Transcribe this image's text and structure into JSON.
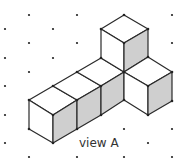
{
  "caption": "view A",
  "colors": {
    "line": "#2a2a2a",
    "shade": "#cfcfcf",
    "face": "#ffffff",
    "dot": "#222222"
  },
  "diagram": {
    "type": "isometric-cube-drawing",
    "cube_count": 6
  }
}
